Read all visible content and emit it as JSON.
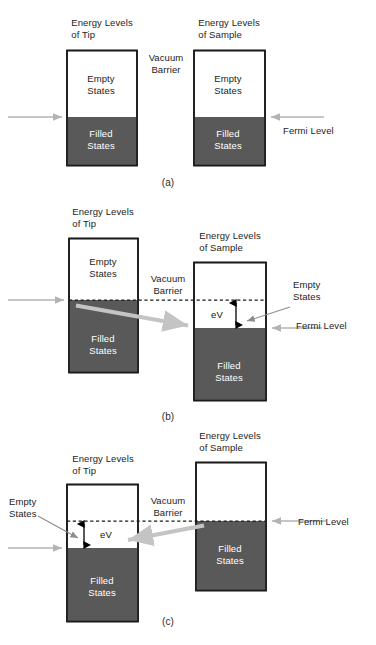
{
  "figure": {
    "type": "diagram",
    "colors": {
      "filled_states_fill": "#595959",
      "box_outline": "#1a1a1a",
      "fermi_arrow": "#b3b3b3",
      "tunneling_arrow": "#c4c4c4",
      "leader_line": "#8c8c8c",
      "dashed_fermi_line": "#1a1a1a",
      "ev_arrow": "#000000",
      "background": "#ffffff",
      "text": "#1d1d1d",
      "text_on_fill": "#ffffff"
    },
    "caption_partial": ""
  },
  "panels": [
    {
      "id": "a",
      "panel_label": "(a)",
      "description": "Zero bias: tip and sample Fermi levels aligned",
      "tip": {
        "title_line1": "Energy Levels",
        "title_line2": "of Tip",
        "empty_line1": "Empty",
        "empty_line2": "States",
        "filled_line1": "Filled",
        "filled_line2": "States"
      },
      "sample": {
        "title_line1": "Energy Levels",
        "title_line2": "of Sample",
        "empty_line1": "Empty",
        "empty_line2": "States",
        "filled_line1": "Filled",
        "filled_line2": "States"
      },
      "barrier_line1": "Vacuum",
      "barrier_line2": "Barrier",
      "fermi_label": "Fermi Level",
      "bias_label": null
    },
    {
      "id": "b",
      "panel_label": "(b)",
      "description": "Sample biased negative relative to tip: electrons tunnel from tip filled states into sample empty states",
      "tip": {
        "title_line1": "Energy Levels",
        "title_line2": "of Tip",
        "empty_line1": "Empty",
        "empty_line2": "States",
        "filled_line1": "Filled",
        "filled_line2": "States"
      },
      "sample": {
        "title_line1": "Energy Levels",
        "title_line2": "of Sample",
        "empty_line1": "Empty",
        "empty_line2": "States",
        "filled_line1": "Filled",
        "filled_line2": "States"
      },
      "barrier_line1": "Vacuum",
      "barrier_line2": "Barrier",
      "fermi_label": "Fermi Level",
      "bias_label": "eV"
    },
    {
      "id": "c",
      "panel_label": "(c)",
      "description": "Sample biased positive relative to tip: electrons tunnel from sample filled states into tip empty states",
      "tip": {
        "title_line1": "Energy Levels",
        "title_line2": "of Tip",
        "empty_line1": "Empty",
        "empty_line2": "States",
        "filled_line1": "Filled",
        "filled_line2": "States"
      },
      "sample": {
        "title_line1": "Energy Levels",
        "title_line2": "of Sample",
        "filled_line1": "Filled",
        "filled_line2": "States"
      },
      "barrier_line1": "Vacuum",
      "barrier_line2": "Barrier",
      "fermi_label": "Fermi Level",
      "bias_label": "eV"
    }
  ]
}
